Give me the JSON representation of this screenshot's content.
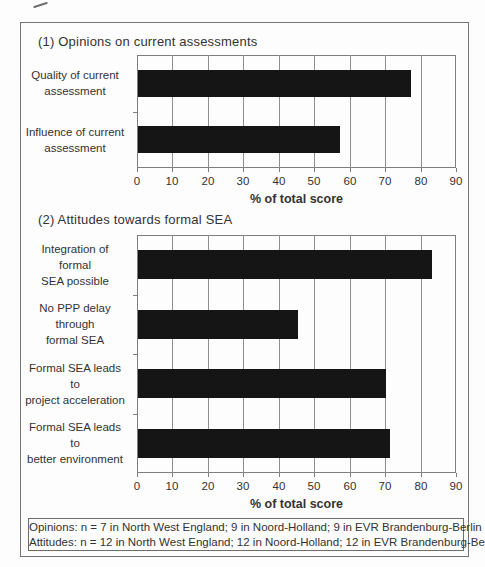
{
  "figure": {
    "colors": {
      "bar": "#151515",
      "grid": "#8f8f8f",
      "frame": "#757575",
      "text": "#333333",
      "background": "#fdfdfd"
    }
  },
  "chart_data": [
    {
      "type": "bar",
      "orientation": "horizontal",
      "title": "(1) Opinions on current assessments",
      "categories": [
        "Quality of current assessment",
        "Influence of current assessment"
      ],
      "category_lines": [
        [
          "Quality of current",
          "assessment"
        ],
        [
          "Influence of current",
          "assessment"
        ]
      ],
      "values": [
        77,
        57
      ],
      "xlabel": "% of total score",
      "xlim": [
        0,
        90
      ],
      "xticks": [
        0,
        10,
        20,
        30,
        40,
        50,
        60,
        70,
        80,
        90
      ],
      "grid": true,
      "legend": "none"
    },
    {
      "type": "bar",
      "orientation": "horizontal",
      "title": "(2) Attitudes towards formal SEA",
      "categories": [
        "Integration of formal SEA possible",
        "No PPP delay through formal SEA",
        "Formal SEA leads to project acceleration",
        "Formal SEA leads to better environment"
      ],
      "category_lines": [
        [
          "Integration of formal",
          "SEA possible"
        ],
        [
          "No PPP delay through",
          "formal SEA"
        ],
        [
          "Formal SEA leads to",
          "project acceleration"
        ],
        [
          "Formal SEA leads to",
          "better environment"
        ]
      ],
      "values": [
        83,
        45,
        70,
        71
      ],
      "xlabel": "% of total score",
      "xlim": [
        0,
        90
      ],
      "xticks": [
        0,
        10,
        20,
        30,
        40,
        50,
        60,
        70,
        80,
        90
      ],
      "grid": true,
      "legend": "none"
    }
  ],
  "footnote": {
    "line1": "Opinions: n = 7 in North West England; 9 in Noord-Holland; 9 in EVR Brandenburg-Berlin",
    "line2": "Attitudes: n = 12 in North West England; 12 in Noord-Holland; 12 in EVR Brandenburg-Berlin"
  }
}
